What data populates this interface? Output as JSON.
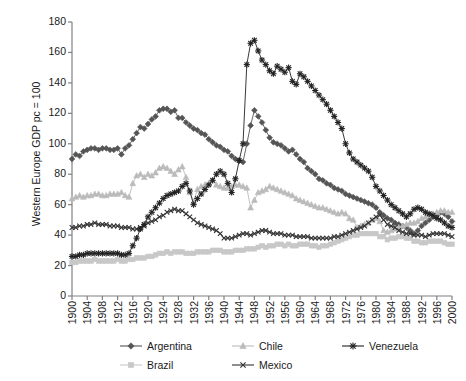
{
  "chart_data": {
    "type": "line",
    "title": "",
    "subtitle": "",
    "xlabel": "",
    "ylabel": "Western Europe GDP pc = 100",
    "xlim": [
      1900,
      2000
    ],
    "ylim": [
      0,
      180
    ],
    "ytick_step": 20,
    "xtick_step": 4,
    "grid": false,
    "legend_position": "bottom",
    "yticks": [
      0,
      20,
      40,
      60,
      80,
      100,
      120,
      140,
      160,
      180
    ],
    "xticks": [
      1900,
      1904,
      1908,
      1912,
      1916,
      1920,
      1924,
      1928,
      1932,
      1936,
      1940,
      1944,
      1948,
      1952,
      1956,
      1960,
      1964,
      1968,
      1972,
      1976,
      1980,
      1984,
      1988,
      1992,
      1996,
      2000
    ],
    "x": [
      1900,
      1901,
      1902,
      1903,
      1904,
      1905,
      1906,
      1907,
      1908,
      1909,
      1910,
      1911,
      1912,
      1913,
      1914,
      1915,
      1916,
      1917,
      1918,
      1919,
      1920,
      1921,
      1922,
      1923,
      1924,
      1925,
      1926,
      1927,
      1928,
      1929,
      1930,
      1931,
      1932,
      1933,
      1934,
      1935,
      1936,
      1937,
      1938,
      1939,
      1940,
      1941,
      1942,
      1943,
      1944,
      1945,
      1946,
      1947,
      1948,
      1949,
      1950,
      1951,
      1952,
      1953,
      1954,
      1955,
      1956,
      1957,
      1958,
      1959,
      1960,
      1961,
      1962,
      1963,
      1964,
      1965,
      1966,
      1967,
      1968,
      1969,
      1970,
      1971,
      1972,
      1973,
      1974,
      1975,
      1976,
      1977,
      1978,
      1979,
      1980,
      1981,
      1982,
      1983,
      1984,
      1985,
      1986,
      1987,
      1988,
      1989,
      1990,
      1991,
      1992,
      1993,
      1994,
      1995,
      1996,
      1997,
      1998,
      1999,
      2000
    ],
    "series": [
      {
        "name": "Argentina",
        "marker": "diamond",
        "color": "#555555",
        "values": [
          90,
          93,
          92,
          95,
          96,
          97,
          97,
          96,
          97,
          97,
          96,
          96,
          97,
          93,
          97,
          99,
          103,
          107,
          111,
          110,
          113,
          116,
          118,
          122,
          123,
          123,
          121,
          122,
          117,
          117,
          114,
          112,
          110,
          109,
          107,
          106,
          103,
          101,
          99,
          98,
          96,
          95,
          92,
          90,
          89,
          88,
          100,
          112,
          122,
          118,
          114,
          109,
          104,
          101,
          100,
          99,
          97,
          95,
          96,
          93,
          90,
          88,
          84,
          82,
          80,
          77,
          76,
          74,
          73,
          71,
          70,
          69,
          67,
          66,
          65,
          64,
          63,
          62,
          61,
          60,
          58,
          55,
          53,
          51,
          50,
          48,
          47,
          46,
          45,
          43,
          41,
          43,
          46,
          48,
          50,
          52,
          53,
          55,
          54,
          52,
          49
        ]
      },
      {
        "name": "Brazil",
        "marker": "square",
        "color": "#c8c8c8",
        "values": [
          22,
          22,
          23,
          23,
          23,
          23,
          24,
          23,
          23,
          23,
          23,
          23,
          24,
          23,
          23,
          24,
          24,
          25,
          25,
          25,
          26,
          26,
          27,
          28,
          28,
          29,
          28,
          29,
          29,
          29,
          28,
          28,
          28,
          29,
          29,
          29,
          29,
          30,
          30,
          30,
          29,
          29,
          29,
          30,
          30,
          30,
          31,
          31,
          31,
          32,
          33,
          32,
          33,
          33,
          34,
          34,
          33,
          34,
          33,
          33,
          34,
          34,
          34,
          33,
          33,
          32,
          33,
          33,
          34,
          35,
          36,
          37,
          38,
          39,
          40,
          40,
          41,
          41,
          41,
          41,
          41,
          39,
          39,
          37,
          38,
          38,
          39,
          39,
          38,
          38,
          36,
          36,
          35,
          35,
          36,
          36,
          36,
          36,
          35,
          34,
          34
        ]
      },
      {
        "name": "Chile",
        "marker": "triangle",
        "color": "#bbbbbb",
        "values": [
          64,
          65,
          66,
          65,
          66,
          66,
          67,
          67,
          66,
          66,
          67,
          67,
          67,
          68,
          66,
          65,
          74,
          79,
          80,
          78,
          80,
          79,
          81,
          84,
          85,
          84,
          82,
          80,
          83,
          85,
          78,
          68,
          62,
          70,
          72,
          73,
          74,
          76,
          73,
          72,
          71,
          71,
          72,
          73,
          73,
          72,
          71,
          58,
          63,
          68,
          69,
          70,
          72,
          71,
          70,
          69,
          68,
          67,
          66,
          64,
          63,
          62,
          61,
          60,
          59,
          58,
          58,
          57,
          56,
          55,
          54,
          55,
          54,
          51,
          50,
          45,
          46,
          47,
          48,
          50,
          51,
          49,
          43,
          42,
          43,
          44,
          45,
          46,
          47,
          48,
          48,
          49,
          51,
          52,
          53,
          54,
          55,
          56,
          56,
          55,
          55
        ]
      },
      {
        "name": "Mexico",
        "marker": "cross",
        "color": "#333333",
        "values": [
          45,
          45,
          46,
          46,
          47,
          47,
          48,
          47,
          47,
          47,
          46,
          46,
          46,
          45,
          45,
          45,
          44,
          44,
          45,
          46,
          48,
          49,
          50,
          52,
          53,
          55,
          56,
          57,
          56,
          56,
          54,
          52,
          50,
          48,
          47,
          46,
          45,
          44,
          43,
          41,
          38,
          38,
          38,
          39,
          40,
          41,
          41,
          40,
          41,
          42,
          43,
          43,
          42,
          41,
          41,
          41,
          40,
          40,
          40,
          39,
          39,
          39,
          39,
          38,
          38,
          38,
          38,
          38,
          38,
          39,
          39,
          40,
          41,
          42,
          43,
          44,
          45,
          46,
          48,
          50,
          52,
          53,
          50,
          47,
          46,
          45,
          43,
          42,
          41,
          41,
          40,
          40,
          40,
          39,
          40,
          41,
          41,
          41,
          41,
          40,
          39
        ]
      },
      {
        "name": "Venezuela",
        "marker": "star",
        "color": "#222222",
        "values": [
          26,
          26,
          27,
          27,
          28,
          28,
          28,
          28,
          28,
          28,
          28,
          28,
          28,
          27,
          27,
          28,
          33,
          38,
          44,
          47,
          52,
          55,
          58,
          61,
          64,
          66,
          67,
          68,
          69,
          72,
          74,
          69,
          60,
          64,
          67,
          70,
          73,
          76,
          80,
          82,
          80,
          74,
          68,
          77,
          89,
          100,
          152,
          166,
          168,
          161,
          155,
          152,
          148,
          146,
          151,
          149,
          147,
          150,
          141,
          139,
          146,
          144,
          141,
          138,
          135,
          132,
          129,
          126,
          122,
          118,
          114,
          110,
          100,
          94,
          90,
          88,
          86,
          84,
          82,
          78,
          72,
          69,
          66,
          63,
          60,
          58,
          56,
          54,
          52,
          54,
          57,
          58,
          57,
          55,
          54,
          53,
          51,
          50,
          48,
          46,
          45
        ]
      }
    ]
  },
  "axis": {
    "ylabel_text": "Western Europe GDP pc = 100"
  },
  "legend": {
    "rows": [
      [
        {
          "label": "Argentina",
          "marker": "diamond",
          "color": "#555555"
        },
        {
          "label": "Chile",
          "marker": "triangle",
          "color": "#bbbbbb"
        },
        {
          "label": "Venezuela",
          "marker": "star",
          "color": "#222222"
        }
      ],
      [
        {
          "label": "Brazil",
          "marker": "square",
          "color": "#c8c8c8"
        },
        {
          "label": "Mexico",
          "marker": "cross",
          "color": "#333333"
        }
      ]
    ]
  }
}
